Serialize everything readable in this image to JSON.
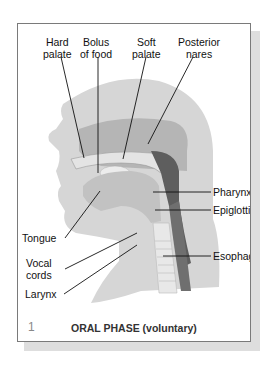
{
  "figure": {
    "number": "1",
    "caption": "ORAL PHASE (voluntary)",
    "colors": {
      "frame_border": "#7a7a7a",
      "shadow": "#dedede",
      "head_light": "#d6d6d6",
      "head_mid": "#b0b0b0",
      "pharynx_dark": "#5e5e5e",
      "esophagus_dark": "#6a6a6a"
    }
  },
  "labels": {
    "top": [
      {
        "id": "hard-palate",
        "line1": "Hard",
        "line2": "palate"
      },
      {
        "id": "bolus",
        "line1": "Bolus",
        "line2": "of food"
      },
      {
        "id": "soft-palate",
        "line1": "Soft",
        "line2": "palate"
      },
      {
        "id": "posterior-nares",
        "line1": "Posterior",
        "line2": "nares"
      }
    ],
    "right": [
      {
        "id": "pharynx",
        "text": "Pharynx"
      },
      {
        "id": "epiglottis",
        "text": "Epiglottis"
      },
      {
        "id": "esophagus",
        "text": "Esophagus"
      }
    ],
    "left": [
      {
        "id": "tongue",
        "text": "Tongue"
      },
      {
        "id": "vocal-cords",
        "line1": "Vocal",
        "line2": "cords"
      },
      {
        "id": "larynx",
        "text": "Larynx"
      }
    ]
  }
}
